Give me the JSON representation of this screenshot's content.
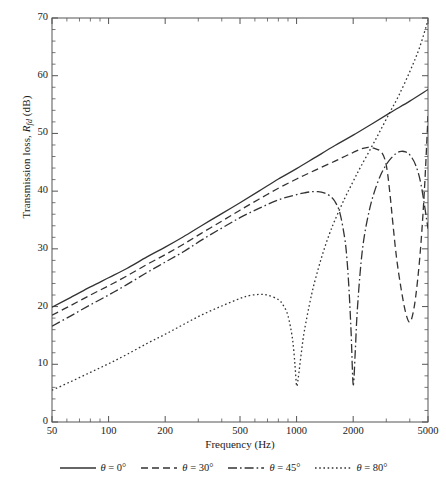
{
  "figure": {
    "background": "#ffffff",
    "line_color": "#333333",
    "axis_color": "#555555"
  },
  "chart_data": {
    "type": "line",
    "title": "",
    "xlabel": "Frequency (Hz)",
    "ylabel": "Transmission loss, R_fd (dB)",
    "ylabel_parts": {
      "prefix": "Transmission loss, ",
      "symbol": "R",
      "subscript": "fd",
      "suffix": " (dB)"
    },
    "xscale": "log",
    "yscale": "linear",
    "xlim": [
      50,
      5000
    ],
    "ylim": [
      0,
      70
    ],
    "grid": false,
    "xticks": [
      50,
      100,
      200,
      500,
      1000,
      2000,
      5000
    ],
    "xtick_labels": [
      "50",
      "100",
      "200",
      "500",
      "1000",
      "2000",
      "5000"
    ],
    "yticks": [
      0,
      10,
      20,
      30,
      40,
      50,
      60,
      70
    ],
    "ytick_labels": [
      "0",
      "10",
      "20",
      "30",
      "40",
      "50",
      "60",
      "70"
    ],
    "y_minor_step": 2,
    "legend_position": "below-center",
    "series": [
      {
        "name": "theta = 0 deg",
        "label_prefix": "θ",
        "label_value": " = 0°",
        "dash": "solid",
        "dasharray": "",
        "color": "#333333",
        "width": 1.3,
        "x": [
          50,
          63,
          80,
          100,
          125,
          160,
          200,
          250,
          315,
          400,
          500,
          630,
          800,
          1000,
          1250,
          1600,
          2000,
          2500,
          3150,
          4000,
          5000
        ],
        "y": [
          19.9,
          21.6,
          23.4,
          25.0,
          26.6,
          28.6,
          30.3,
          32.1,
          34.1,
          36.1,
          38.0,
          40.0,
          42.1,
          43.9,
          45.8,
          47.9,
          49.7,
          51.6,
          53.6,
          55.6,
          57.6
        ]
      },
      {
        "name": "theta = 30 deg",
        "label_prefix": "θ",
        "label_value": " = 30°",
        "dash": "dashed",
        "dasharray": "7,4",
        "color": "#333333",
        "width": 1.3,
        "x": [
          50,
          63,
          80,
          100,
          125,
          160,
          200,
          250,
          315,
          400,
          500,
          630,
          800,
          1000,
          1250,
          1600,
          1800,
          2000,
          2200,
          2400,
          2600,
          2800,
          2950,
          3050,
          3150,
          3250,
          3400,
          3600,
          3800,
          4000,
          4200,
          4400,
          4600,
          4800,
          5000
        ],
        "y": [
          18.5,
          20.2,
          22.0,
          23.6,
          25.3,
          27.3,
          29.0,
          30.8,
          32.8,
          34.8,
          36.7,
          38.6,
          40.5,
          42.1,
          43.6,
          45.2,
          46.0,
          46.7,
          47.3,
          47.6,
          47.4,
          46.9,
          45.5,
          43.0,
          39.0,
          34.5,
          28.5,
          23.0,
          19.0,
          17.3,
          19.5,
          24.5,
          31.5,
          41.0,
          53.0
        ]
      },
      {
        "name": "theta = 45 deg",
        "label_prefix": "θ",
        "label_value": " = 45°",
        "dash": "dashdot",
        "dasharray": "9,3,1.6,3",
        "color": "#333333",
        "width": 1.3,
        "x": [
          50,
          63,
          80,
          100,
          125,
          160,
          200,
          250,
          315,
          400,
          500,
          630,
          800,
          1000,
          1100,
          1200,
          1300,
          1400,
          1500,
          1600,
          1700,
          1800,
          1850,
          1900,
          1950,
          2000,
          2050,
          2100,
          2200,
          2300,
          2450,
          2600,
          2800,
          3000,
          3200,
          3400,
          3600,
          3800,
          4000,
          4300,
          4600,
          5000
        ],
        "y": [
          16.6,
          18.4,
          20.3,
          22.0,
          23.8,
          25.9,
          27.7,
          29.5,
          31.6,
          33.6,
          35.4,
          37.0,
          38.5,
          39.4,
          39.7,
          39.9,
          39.9,
          39.7,
          39.2,
          38.2,
          36.2,
          32.0,
          28.5,
          23.0,
          15.5,
          6.5,
          12.0,
          19.0,
          27.5,
          32.5,
          37.0,
          40.0,
          42.8,
          44.6,
          45.8,
          46.6,
          46.9,
          46.8,
          46.3,
          44.5,
          41.0,
          33.5
        ]
      },
      {
        "name": "theta = 80 deg",
        "label_prefix": "θ",
        "label_value": " = 80°",
        "dash": "dotted",
        "dasharray": "1.6,2.6",
        "color": "#333333",
        "width": 1.3,
        "x": [
          50,
          63,
          80,
          100,
          125,
          160,
          200,
          250,
          315,
          400,
          500,
          560,
          630,
          700,
          800,
          850,
          900,
          950,
          980,
          1000,
          1020,
          1060,
          1100,
          1200,
          1300,
          1400,
          1500,
          1600,
          1800,
          2000,
          2200,
          2500,
          2800,
          3150,
          3500,
          4000,
          4500,
          5000
        ],
        "y": [
          5.5,
          7.0,
          8.6,
          10.1,
          11.7,
          13.6,
          15.2,
          16.9,
          18.6,
          20.1,
          21.4,
          21.9,
          22.1,
          22.0,
          21.2,
          20.2,
          18.4,
          14.5,
          10.0,
          6.3,
          7.6,
          12.0,
          15.8,
          22.0,
          26.4,
          29.9,
          32.7,
          35.0,
          38.7,
          41.7,
          44.3,
          47.6,
          50.6,
          53.8,
          56.6,
          60.7,
          64.8,
          69.6
        ]
      }
    ]
  },
  "legend": {
    "items": [
      {
        "label": "θ = 0°",
        "dash": "solid"
      },
      {
        "label": "θ = 30°",
        "dash": "dashed"
      },
      {
        "label": "θ = 45°",
        "dash": "dashdot"
      },
      {
        "label": "θ = 80°",
        "dash": "dotted"
      }
    ]
  }
}
